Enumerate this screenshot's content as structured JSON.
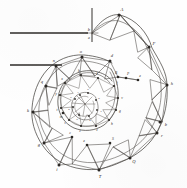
{
  "figure": {
    "kind": "engraving-diagram",
    "width": 187,
    "height": 188,
    "background_color": "#fefefe",
    "ink_color": "#3a3632",
    "rule_color": "#2e2b28"
  },
  "axes": {
    "vertical_axis_label": "",
    "horizontal_rule_upper_label": "",
    "horizontal_rule_lower_label": "",
    "origin_label_upper": "b",
    "origin_label_lower": "a"
  },
  "outer_ring": {
    "note": "outermost spiral arc, triangulated bays",
    "labels": [
      "A",
      "F",
      "h",
      "b",
      "r",
      "Q",
      "T",
      "S",
      "e",
      "i",
      "c",
      "g",
      "k",
      "m",
      "q",
      "n",
      "o",
      "d",
      "B",
      "P",
      "e"
    ]
  },
  "middle_ring": {
    "note": "inner spiral arc, triangulated bays",
    "labels": [
      "b",
      "l",
      "f",
      "v",
      "g",
      "h",
      "z",
      "c",
      "s",
      "t",
      "y",
      "x",
      "p",
      "m"
    ]
  },
  "inner_coil": {
    "note": "innermost dense coil of small marks",
    "labels": [
      "r",
      "n",
      "a",
      "s",
      "d",
      "e",
      "o",
      "u",
      "i"
    ]
  },
  "outer_vertices": [
    {
      "id": "A",
      "x": 119,
      "y": 15,
      "label": "A"
    },
    {
      "id": "F",
      "x": 149,
      "y": 47,
      "label": "F"
    },
    {
      "id": "h",
      "x": 167,
      "y": 85,
      "label": "h"
    },
    {
      "id": "b",
      "x": 162,
      "y": 122,
      "label": "b"
    },
    {
      "id": "r",
      "x": 157,
      "y": 133,
      "label": "r"
    },
    {
      "id": "Q",
      "x": 130,
      "y": 158,
      "label": "Q"
    },
    {
      "id": "T",
      "x": 99,
      "y": 170,
      "label": "T"
    },
    {
      "id": "S",
      "x": 110,
      "y": 143,
      "label": "S"
    },
    {
      "id": "e",
      "x": 87,
      "y": 145,
      "label": "e"
    },
    {
      "id": "i",
      "x": 59,
      "y": 165,
      "label": "i"
    },
    {
      "id": "c",
      "x": 72,
      "y": 137,
      "label": "c"
    },
    {
      "id": "g",
      "x": 44,
      "y": 143,
      "label": "g"
    },
    {
      "id": "k",
      "x": 33,
      "y": 112,
      "label": "k"
    },
    {
      "id": "m",
      "x": 63,
      "y": 113,
      "label": "m"
    },
    {
      "id": "q",
      "x": 46,
      "y": 86,
      "label": "q"
    },
    {
      "id": "n",
      "x": 56,
      "y": 66,
      "label": "n"
    },
    {
      "id": "o",
      "x": 82,
      "y": 57,
      "label": "o"
    },
    {
      "id": "d",
      "x": 110,
      "y": 61,
      "label": "d"
    },
    {
      "id": "B",
      "x": 118,
      "y": 77,
      "label": "B"
    },
    {
      "id": "P",
      "x": 126,
      "y": 78,
      "label": "P"
    },
    {
      "id": "e2",
      "x": 138,
      "y": 80,
      "label": "e"
    }
  ],
  "middle_vertices": [
    {
      "id": "mb",
      "x": 81,
      "y": 75,
      "label": "b"
    },
    {
      "id": "ml",
      "x": 98,
      "y": 78,
      "label": "l"
    },
    {
      "id": "mf",
      "x": 114,
      "y": 86,
      "label": "f"
    },
    {
      "id": "mv",
      "x": 118,
      "y": 98,
      "label": "v"
    },
    {
      "id": "mg",
      "x": 116,
      "y": 110,
      "label": "g"
    },
    {
      "id": "mh",
      "x": 109,
      "y": 120,
      "label": "h"
    },
    {
      "id": "mz",
      "x": 96,
      "y": 126,
      "label": "z"
    },
    {
      "id": "mc",
      "x": 81,
      "y": 126,
      "label": "c"
    },
    {
      "id": "ms",
      "x": 69,
      "y": 120,
      "label": "s"
    },
    {
      "id": "mt",
      "x": 61,
      "y": 108,
      "label": "t"
    },
    {
      "id": "my",
      "x": 60,
      "y": 95,
      "label": "y"
    },
    {
      "id": "mx",
      "x": 65,
      "y": 83,
      "label": "x"
    }
  ],
  "inner_marks": [
    {
      "id": "ir",
      "x": 80,
      "y": 95,
      "label": "r"
    },
    {
      "id": "in",
      "x": 88,
      "y": 93,
      "label": "n"
    },
    {
      "id": "ia",
      "x": 96,
      "y": 100,
      "label": "a"
    },
    {
      "id": "is",
      "x": 97,
      "y": 110,
      "label": "s"
    },
    {
      "id": "id",
      "x": 89,
      "y": 116,
      "label": "d"
    },
    {
      "id": "ie",
      "x": 79,
      "y": 115,
      "label": "e"
    },
    {
      "id": "io",
      "x": 73,
      "y": 107,
      "label": "o"
    },
    {
      "id": "iu",
      "x": 75,
      "y": 99,
      "label": "u"
    }
  ],
  "rules": [
    {
      "id": "upper-rule",
      "x1": 10,
      "y1": 33,
      "x2": 88,
      "y2": 33
    },
    {
      "id": "lower-rule",
      "x1": 10,
      "y1": 65,
      "x2": 62,
      "y2": 65
    }
  ],
  "vertical_axis": {
    "x1": 92,
    "y1": 8,
    "x2": 92,
    "y2": 42
  }
}
